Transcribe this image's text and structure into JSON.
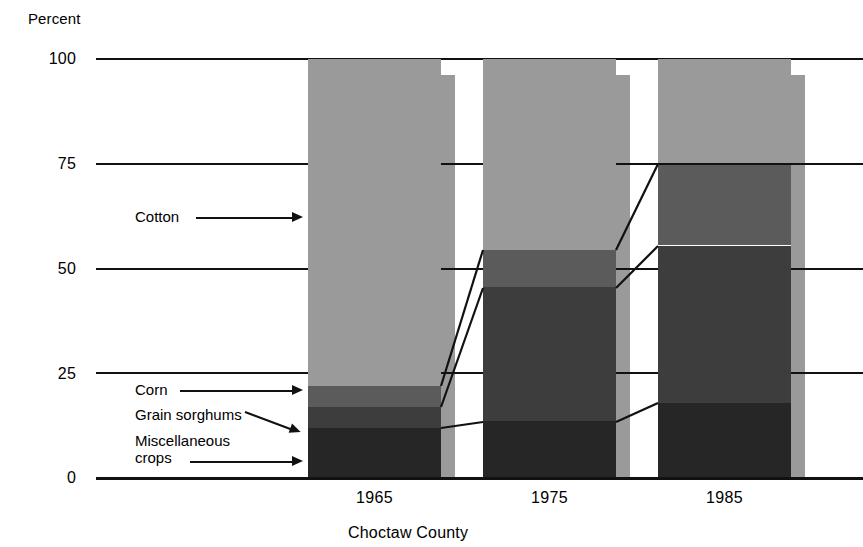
{
  "axis": {
    "y_unit_label": "Percent",
    "y_ticks": [
      "100",
      "75",
      "50",
      "25",
      "0"
    ],
    "x_ticks": [
      "1965",
      "1975",
      "1985"
    ]
  },
  "caption": "Choctaw County",
  "callouts": {
    "cotton": "Cotton",
    "corn": "Corn",
    "grain_sorghums": "Grain sorghums",
    "misc_crops_line1": "Miscellaneous",
    "misc_crops_line2": "crops"
  },
  "colors": {
    "cotton": "#9a9a9a",
    "corn": "#5b5b5b",
    "grain_sorghums": "#3d3d3d",
    "misc_crops": "#262626",
    "shadow": "#9a9a9a",
    "axis": "#111111",
    "background": "#ffffff"
  },
  "chart_data": {
    "type": "bar",
    "title": "",
    "subtitle": "",
    "xlabel": "Choctaw County",
    "ylabel": "Percent",
    "ylim": [
      0,
      100
    ],
    "grid": true,
    "stacked": true,
    "legend_position": "callout-labels",
    "categories": [
      "1965",
      "1975",
      "1985"
    ],
    "series": [
      {
        "name": "Miscellaneous crops",
        "values": [
          12,
          13.5,
          18
        ]
      },
      {
        "name": "Grain sorghums",
        "values": [
          5,
          32,
          37.5
        ]
      },
      {
        "name": "Corn",
        "values": [
          5,
          9,
          19.5
        ]
      },
      {
        "name": "Cotton",
        "values": [
          78,
          45.5,
          25
        ]
      }
    ],
    "yticks": [
      0,
      25,
      50,
      75,
      100
    ],
    "annotations": [
      "Cotton label points to the cotton segment of the 1965 bar",
      "Corn label points to the corn segment of the 1965 bar",
      "Grain sorghums label points to the grain sorghums segment of the 1965 bar",
      "Miscellaneous crops label points to the bottom segment of the 1965 bar"
    ]
  }
}
